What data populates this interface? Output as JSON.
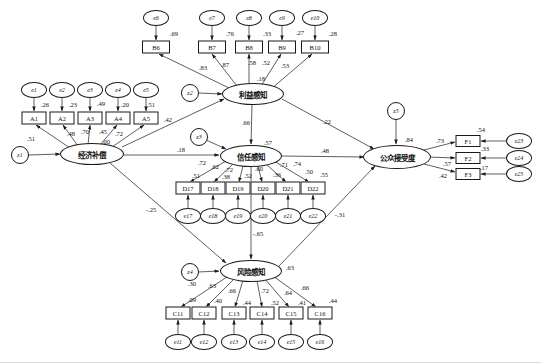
{
  "latents": {
    "economic": {
      "label": "经济补偿"
    },
    "benefit": {
      "label": "利益感知",
      "r2": ".18"
    },
    "trust": {
      "label": "信任感知",
      "r2": ".57"
    },
    "risk": {
      "label": "风险感知",
      "r2": ".63"
    },
    "acceptance": {
      "label": "公众接受度",
      "r2": ".84"
    }
  },
  "disturbances": {
    "z1": "z1",
    "z2": "z2",
    "z3": "z3",
    "z4": "z4",
    "z5": "z5"
  },
  "structural_paths": {
    "economic_to_benefit": ".42",
    "economic_to_trust": ".18",
    "economic_to_risk": "-.25",
    "benefit_to_trust": ".66",
    "benefit_to_acceptance": ".22",
    "trust_to_acceptance": ".48",
    "trust_to_risk": "-.65",
    "risk_to_acceptance": "-.31"
  },
  "extra_labels": {
    "a4_zero": ".00"
  },
  "indicator_groups": {
    "A": {
      "latent": "经济补偿",
      "items": [
        {
          "id": "A1",
          "error": "e1",
          "loading": ".51",
          "r2": ".26"
        },
        {
          "id": "A2",
          "error": "e2",
          "loading": ".48",
          "r2": ".23"
        },
        {
          "id": "A3",
          "error": "e3",
          "loading": ".70",
          "r2": ".49"
        },
        {
          "id": "A4",
          "error": "e4",
          "loading": ".45",
          "r2": ".20"
        },
        {
          "id": "A5",
          "error": "e5",
          "loading": ".72",
          "r2": ".51"
        }
      ]
    },
    "B": {
      "latent": "利益感知",
      "items": [
        {
          "id": "B6",
          "error": "e6",
          "loading": ".83",
          "r2": ".69"
        },
        {
          "id": "B7",
          "error": "e7",
          "loading": ".87",
          "r2": ".76"
        },
        {
          "id": "B8",
          "error": "e8",
          "loading": ".58",
          "r2": ".33"
        },
        {
          "id": "B9",
          "error": "e9",
          "loading": ".52",
          "r2": ".27"
        },
        {
          "id": "B10",
          "error": "e10",
          "loading": ".53",
          "r2": ".28"
        }
      ]
    },
    "D": {
      "latent": "信任感知",
      "items": [
        {
          "id": "D17",
          "error": "e17",
          "loading": ".72",
          "r2": ".51"
        },
        {
          "id": "D18",
          "error": "e18",
          "loading": ".62",
          "r2": ".38"
        },
        {
          "id": "D19",
          "error": "e19",
          "loading": ".72",
          "r2": ".52"
        },
        {
          "id": "D20",
          "error": "e20",
          "loading": ".60",
          "r2": ".36"
        },
        {
          "id": "D21",
          "error": "e21",
          "loading": ".71",
          "r2": ".50"
        },
        {
          "id": "D22",
          "error": "e22",
          "loading": ".74",
          "r2": ".55"
        }
      ]
    },
    "C": {
      "latent": "风险感知",
      "items": [
        {
          "id": "C11",
          "error": "e11",
          "loading": ".30",
          "r2": ".09"
        },
        {
          "id": "C12",
          "error": "e12",
          "loading": ".63",
          "r2": ".40"
        },
        {
          "id": "C13",
          "error": "e13",
          "loading": ".66",
          "r2": ".44"
        },
        {
          "id": "C14",
          "error": "e14",
          "loading": ".72",
          "r2": ".52"
        },
        {
          "id": "C15",
          "error": "e15",
          "loading": ".64",
          "r2": ".41"
        },
        {
          "id": "C16",
          "error": "e16",
          "loading": ".66",
          "r2": ".44"
        }
      ]
    },
    "F": {
      "latent": "公众接受度",
      "items": [
        {
          "id": "F1",
          "error": "e23",
          "loading": ".73",
          "r2": ".54"
        },
        {
          "id": "F2",
          "error": "e24",
          "loading": ".57",
          "r2": ".33"
        },
        {
          "id": "F3",
          "error": "e25",
          "loading": ".42",
          "r2": ".17"
        }
      ]
    }
  }
}
